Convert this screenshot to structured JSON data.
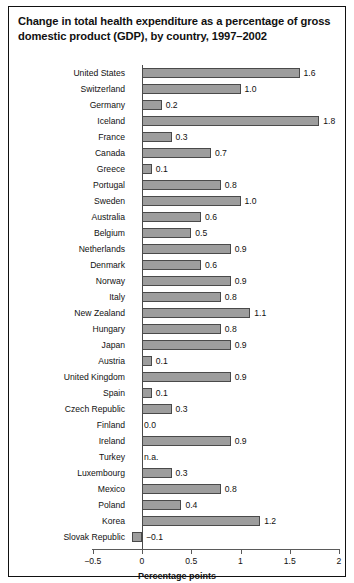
{
  "figure": {
    "title": "Change in total health expenditure as a percentage of gross domestic product (GDP), by country, 1997–2002",
    "note": "Note: Data on Australia, Japan, and Korea are for 2001; data on Turkey are for 2000.",
    "bar_color": "#9d9d9d",
    "bar_border_color": "#4a4a4a",
    "frame_color": "#111111"
  },
  "chart_data": {
    "type": "bar",
    "orientation": "horizontal",
    "title": "Change in total health expenditure as a percentage of gross domestic product (GDP), by country, 1997–2002",
    "xlabel": "Percentage points",
    "ylabel": "",
    "xlim": [
      -0.5,
      2
    ],
    "xticks": [
      -0.5,
      0,
      0.5,
      1,
      1.5,
      2
    ],
    "xticklabels": [
      "−0.5",
      "0",
      "0.5",
      "1",
      "1.5",
      "2"
    ],
    "grid": false,
    "legend": null,
    "categories": [
      "United States",
      "Switzerland",
      "Germany",
      "Iceland",
      "France",
      "Canada",
      "Greece",
      "Portugal",
      "Sweden",
      "Australia",
      "Belgium",
      "Netherlands",
      "Denmark",
      "Norway",
      "Italy",
      "New Zealand",
      "Hungary",
      "Japan",
      "Austria",
      "United Kingdom",
      "Spain",
      "Czech Republic",
      "Finland",
      "Ireland",
      "Turkey",
      "Luxembourg",
      "Mexico",
      "Poland",
      "Korea",
      "Slovak Republic"
    ],
    "values": [
      1.6,
      1.0,
      0.2,
      1.8,
      0.3,
      0.7,
      0.1,
      0.8,
      1.0,
      0.6,
      0.5,
      0.9,
      0.6,
      0.9,
      0.8,
      1.1,
      0.8,
      0.9,
      0.1,
      0.9,
      0.1,
      0.3,
      0.0,
      0.9,
      null,
      0.3,
      0.8,
      0.4,
      1.2,
      -0.1
    ],
    "value_labels": [
      "1.6",
      "1.0",
      "0.2",
      "1.8",
      "0.3",
      "0.7",
      "0.1",
      "0.8",
      "1.0",
      "0.6",
      "0.5",
      "0.9",
      "0.6",
      "0.9",
      "0.8",
      "1.1",
      "0.8",
      "0.9",
      "0.1",
      "0.9",
      "0.1",
      "0.3",
      "0.0",
      "0.9",
      "n.a.",
      "0.3",
      "0.8",
      "0.4",
      "1.2",
      "−0.1"
    ]
  },
  "axis": {
    "title": "Percentage points"
  }
}
